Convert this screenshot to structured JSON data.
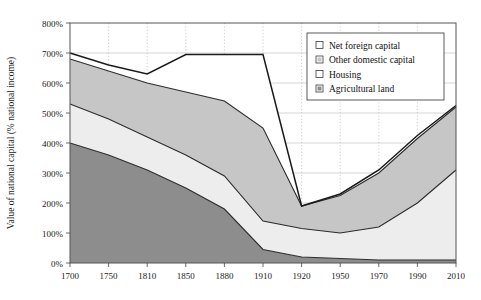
{
  "chart_data": {
    "type": "area",
    "title": "",
    "xlabel": "",
    "ylabel": "Value of national capital (% national income)",
    "categories": [
      "1700",
      "1750",
      "1810",
      "1850",
      "1880",
      "1910",
      "1920",
      "1950",
      "1970",
      "1990",
      "2010"
    ],
    "x_tick_labels": [
      "1700",
      "1750",
      "1810",
      "1850",
      "1880",
      "1910",
      "1920",
      "1950",
      "1970",
      "1990",
      "2010"
    ],
    "y_tick_labels": [
      "0%",
      "100%",
      "200%",
      "300%",
      "400%",
      "500%",
      "600%",
      "700%",
      "800%"
    ],
    "y_tick_values": [
      0,
      100,
      200,
      300,
      400,
      500,
      600,
      700,
      800
    ],
    "ylim": [
      0,
      800
    ],
    "grid": "vertical-dotted-and-horizontal",
    "legend_position": "upper-right",
    "stacked": true,
    "series": [
      {
        "name": "Agricultural land",
        "color": "#8d8d8d",
        "swatch": "filled-dark-gray",
        "values": [
          400,
          360,
          310,
          250,
          180,
          45,
          20,
          15,
          10,
          10,
          10
        ]
      },
      {
        "name": "Housing",
        "color": "#ededed",
        "swatch": "empty-white",
        "values": [
          130,
          120,
          110,
          110,
          110,
          95,
          95,
          85,
          110,
          190,
          300
        ]
      },
      {
        "name": "Other domestic capital",
        "color": "#c6c6c6",
        "swatch": "filled-light-gray",
        "values": [
          150,
          160,
          180,
          210,
          250,
          310,
          75,
          125,
          180,
          215,
          210
        ]
      },
      {
        "name": "Net foreign capital",
        "color": "#ffffff",
        "swatch": "empty-white",
        "values": [
          20,
          20,
          30,
          125,
          155,
          245,
          0,
          5,
          10,
          10,
          5
        ]
      }
    ],
    "cumulative_tops": {
      "agricultural_land": [
        400,
        360,
        310,
        250,
        180,
        45,
        20,
        15,
        10,
        10,
        10
      ],
      "housing": [
        530,
        480,
        420,
        360,
        290,
        140,
        115,
        100,
        120,
        200,
        310
      ],
      "other_domestic": [
        680,
        640,
        600,
        570,
        540,
        450,
        190,
        225,
        300,
        415,
        520
      ],
      "total": [
        700,
        660,
        630,
        695,
        695,
        695,
        190,
        230,
        310,
        425,
        525
      ]
    }
  },
  "legend": {
    "items": [
      {
        "label": "Net foreign capital"
      },
      {
        "label": "Other domestic capital"
      },
      {
        "label": "Housing"
      },
      {
        "label": "Agricultural land"
      }
    ]
  }
}
